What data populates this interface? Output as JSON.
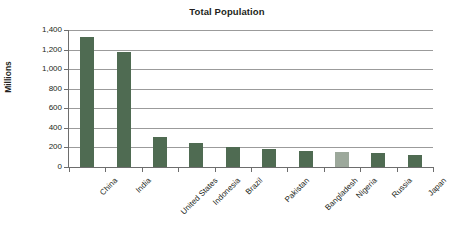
{
  "chart_data": {
    "type": "bar",
    "title": "Total Population",
    "xlabel": "",
    "ylabel": "Millions",
    "ylim": [
      0,
      1400
    ],
    "ytick_step": 200,
    "ytick_labels": [
      "0",
      "200",
      "400",
      "600",
      "800",
      "1,000",
      "1,200",
      "1,400"
    ],
    "ytick_values": [
      0,
      200,
      400,
      600,
      800,
      1000,
      1200,
      1400
    ],
    "grid": true,
    "grid_axis": "y",
    "legend": false,
    "legend_position": "none",
    "categories": [
      "China",
      "India",
      "United States",
      "Indonesia",
      "Brazil",
      "Pakistan",
      "Bangladesh",
      "Nigeria",
      "Russia",
      "Japan"
    ],
    "values": [
      1330,
      1180,
      310,
      243,
      201,
      185,
      160,
      152,
      139,
      127
    ],
    "bar_colors": [
      "#4F6B52",
      "#4F6B52",
      "#4F6B52",
      "#4F6B52",
      "#4F6B52",
      "#4F6B52",
      "#4F6B52",
      "#9CA89B",
      "#4F6B52",
      "#4F6B52"
    ],
    "series": [
      {
        "name": "Total Population",
        "values": [
          1330,
          1180,
          310,
          243,
          201,
          185,
          160,
          152,
          139,
          127
        ]
      }
    ]
  },
  "style": {
    "bar_color": "#4F6B52",
    "highlight_bar_color": "#9CA89B",
    "grid_color": "#9B9B9B",
    "axis_color": "#6D6D6D",
    "text_color": "#231F20",
    "background": "#FFFFFF"
  }
}
